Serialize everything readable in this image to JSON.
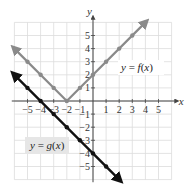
{
  "chart_data": {
    "type": "line",
    "title": "",
    "xlabel": "x",
    "ylabel": "y",
    "xlim": [
      -6,
      6
    ],
    "ylim": [
      -6,
      6
    ],
    "grid": true,
    "x_ticks": [
      -5,
      -4,
      -3,
      -2,
      -1,
      1,
      2,
      3,
      4,
      5
    ],
    "y_ticks": [
      -5,
      -4,
      -3,
      -2,
      -1,
      1,
      2,
      3,
      4,
      5
    ],
    "x_tick_labels": [
      "−5",
      "−4",
      "−3",
      "−2",
      "−1",
      "1",
      "2",
      "3",
      "4",
      "5"
    ],
    "y_tick_labels": [
      "−5",
      "−4",
      "−3",
      "−2",
      "−1",
      "1",
      "2",
      "3",
      "4",
      "5"
    ],
    "series": [
      {
        "name": "y = f(x)",
        "color": "#8a8a8a",
        "points": [
          [
            -5,
            3
          ],
          [
            -4,
            2
          ],
          [
            -3,
            1
          ],
          [
            -2,
            0
          ],
          [
            -1,
            1
          ],
          [
            0,
            2
          ],
          [
            1,
            3
          ],
          [
            2,
            4
          ],
          [
            3,
            5
          ]
        ],
        "line_ends": [
          [
            -6,
            4
          ],
          [
            4,
            6
          ]
        ]
      },
      {
        "name": "y = g(x)",
        "color": "#111111",
        "points": [
          [
            -5,
            1
          ],
          [
            -4,
            0
          ],
          [
            -3,
            -1
          ],
          [
            -2,
            -2
          ],
          [
            -1,
            -3
          ],
          [
            0,
            -4
          ],
          [
            1,
            -5
          ]
        ],
        "line_ends": [
          [
            -6,
            2
          ],
          [
            2,
            -6
          ]
        ]
      }
    ],
    "annotations": [
      {
        "text": "y = f(x)",
        "x": 2.5,
        "y": 2.5
      },
      {
        "text": "y = g(x)",
        "x": -3.5,
        "y": -3.5
      }
    ]
  },
  "labels": {
    "x_axis": "x",
    "y_axis": "y",
    "f_label_lhs": "y = ",
    "f_label_fn": "f",
    "f_label_arg": "(x)",
    "g_label_lhs": "y = ",
    "g_label_fn": "g",
    "g_label_arg": "(x)",
    "f_label_full": "y = f(x)",
    "g_label_full": "y = g(x)"
  },
  "colors": {
    "grid": "#dcdcdc",
    "axis": "#444444",
    "f": "#8a8a8a",
    "g": "#111111",
    "label_bg": "#e6e6e6"
  }
}
